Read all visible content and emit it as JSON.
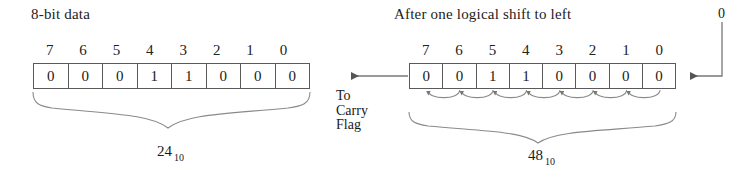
{
  "diagram": {
    "title_left": "8-bit data",
    "title_right": "After one logical shift to left",
    "carry_flag_line1": "To",
    "carry_flag_line2": "Carry",
    "carry_flag_line3": "Flag",
    "shift_in_value": "0",
    "ink_color": "#1a1a1a",
    "box_border_color": "#5a5a5a"
  },
  "before": {
    "bit_indices": [
      "7",
      "6",
      "5",
      "4",
      "3",
      "2",
      "1",
      "0"
    ],
    "bits": [
      "0",
      "0",
      "0",
      "1",
      "1",
      "0",
      "0",
      "0"
    ],
    "decimal_value": "24",
    "decimal_base": "10"
  },
  "after": {
    "bit_indices": [
      "7",
      "6",
      "5",
      "4",
      "3",
      "2",
      "1",
      "0"
    ],
    "bits": [
      "0",
      "0",
      "1",
      "1",
      "0",
      "0",
      "0",
      "0"
    ],
    "decimal_value": "48",
    "decimal_base": "10",
    "shift_arrow_count": 7
  }
}
